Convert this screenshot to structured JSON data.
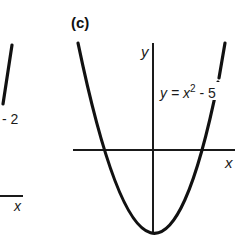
{
  "figure": {
    "panel_label": "(c)",
    "left_panel": {
      "equation_fragment": "- 2",
      "x_axis_label": "x"
    },
    "right_panel": {
      "y_axis_label": "y",
      "x_axis_label": "x",
      "equation_prefix": "y = x",
      "equation_exponent": "2",
      "equation_suffix": " - 5"
    },
    "colors": {
      "curve": "#111111",
      "axis": "#1a1a1a",
      "background": "#ffffff"
    }
  }
}
